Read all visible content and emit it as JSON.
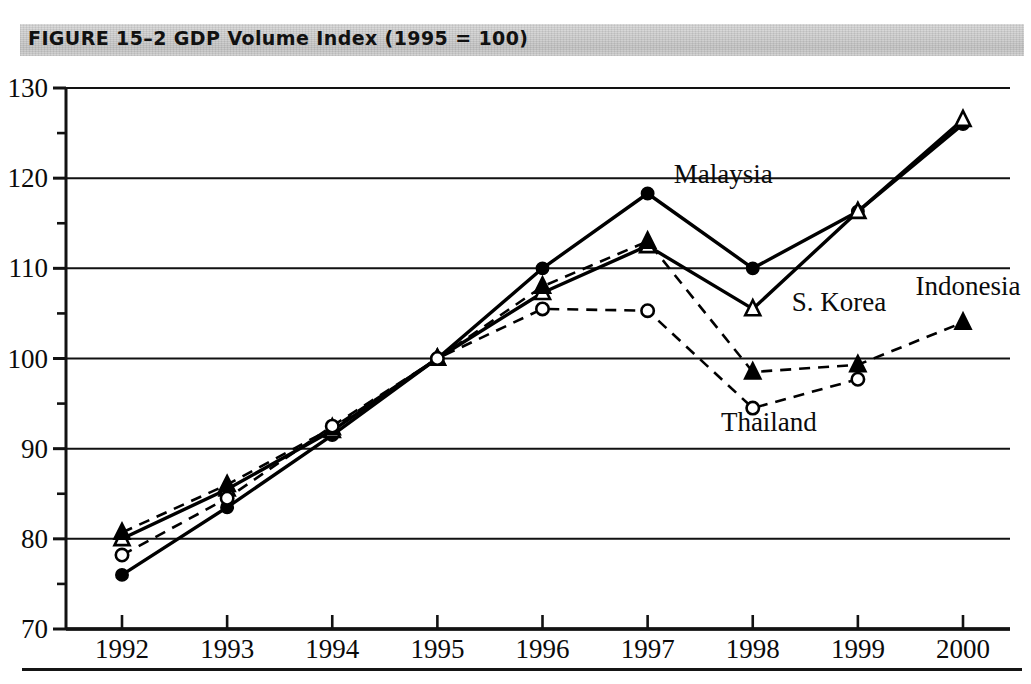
{
  "figure": {
    "label": "FIGURE 15-2",
    "title": "FIGURE 15–2  GDP Volume Index (1995 = 100)",
    "banner_color": "#cfcfcf",
    "ink_color": "#111111"
  },
  "chart_data": {
    "type": "line",
    "title": "GDP Volume Index (1995 = 100)",
    "xlabel": "",
    "ylabel": "",
    "x": [
      1992,
      1993,
      1994,
      1995,
      1996,
      1997,
      1998,
      1999,
      2000
    ],
    "categories": [
      "1992",
      "1993",
      "1994",
      "1995",
      "1996",
      "1997",
      "1998",
      "1999",
      "2000"
    ],
    "xlim": [
      1992,
      2000
    ],
    "ylim": [
      70,
      130
    ],
    "ytick_labels": [
      "70",
      "80",
      "90",
      "100",
      "110",
      "120",
      "130"
    ],
    "ytick_values": [
      70,
      80,
      90,
      100,
      110,
      120,
      130
    ],
    "yminor_step": 5,
    "grid": "horizontal-major",
    "legend_position": "inline-annotations",
    "series": [
      {
        "name": "Malaysia",
        "marker": "filled-circle",
        "line_style": "solid",
        "color": "#000000",
        "values": [
          76.0,
          83.5,
          91.5,
          100.0,
          110.0,
          118.3,
          110.0,
          116.3,
          126.0
        ],
        "label_x": 1997.15,
        "label_y": 119.5
      },
      {
        "name": "S. Korea",
        "marker": "open-triangle",
        "line_style": "solid",
        "color": "#000000",
        "values": [
          80.0,
          85.5,
          92.0,
          100.0,
          107.3,
          112.5,
          105.5,
          116.3,
          126.5
        ],
        "label_x": 1998.15,
        "label_y": 105.3
      },
      {
        "name": "Indonesia",
        "marker": "filled-triangle",
        "line_style": "dashed",
        "color": "#000000",
        "values": [
          80.7,
          86.0,
          92.3,
          100.0,
          108.0,
          113.0,
          98.5,
          99.3,
          104.0
        ],
        "label_x": 1999.2,
        "label_y": 107.0
      },
      {
        "name": "Thailand",
        "marker": "open-circle",
        "line_style": "dashed",
        "color": "#000000",
        "values": [
          78.2,
          84.5,
          92.5,
          100.0,
          105.5,
          105.3,
          94.5,
          97.7,
          null
        ],
        "label_x": 1997.55,
        "label_y": 92.0
      }
    ]
  }
}
